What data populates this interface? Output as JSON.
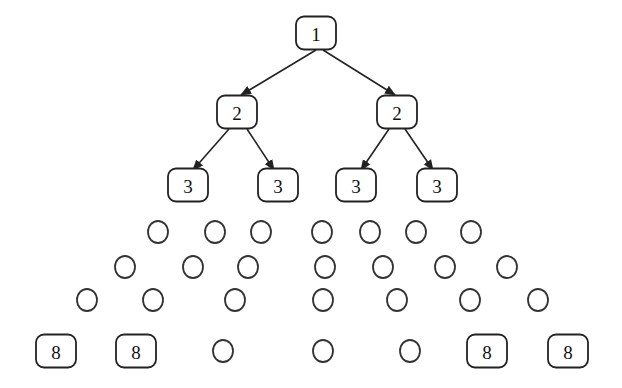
{
  "diagram": {
    "type": "tree",
    "levels": [
      {
        "level": 1,
        "y": 33,
        "nodes": [
          {
            "kind": "box",
            "label": "1",
            "x": 316
          }
        ]
      },
      {
        "level": 2,
        "y": 112,
        "nodes": [
          {
            "kind": "box",
            "label": "2",
            "x": 237
          },
          {
            "kind": "box",
            "label": "2",
            "x": 397
          }
        ]
      },
      {
        "level": 3,
        "y": 185,
        "nodes": [
          {
            "kind": "box",
            "label": "3",
            "x": 188
          },
          {
            "kind": "box",
            "label": "3",
            "x": 278
          },
          {
            "kind": "box",
            "label": "3",
            "x": 356
          },
          {
            "kind": "box",
            "label": "3",
            "x": 437
          }
        ]
      },
      {
        "level": 4,
        "y": 232,
        "nodes": [
          {
            "kind": "circle",
            "x": 158
          },
          {
            "kind": "circle",
            "x": 215
          },
          {
            "kind": "circle",
            "x": 261
          },
          {
            "kind": "circle",
            "x": 322
          },
          {
            "kind": "circle",
            "x": 370
          },
          {
            "kind": "circle",
            "x": 416
          },
          {
            "kind": "circle",
            "x": 471
          }
        ]
      },
      {
        "level": 5,
        "y": 267,
        "nodes": [
          {
            "kind": "circle",
            "x": 125
          },
          {
            "kind": "circle",
            "x": 193
          },
          {
            "kind": "circle",
            "x": 248
          },
          {
            "kind": "circle",
            "x": 325
          },
          {
            "kind": "circle",
            "x": 383
          },
          {
            "kind": "circle",
            "x": 445
          },
          {
            "kind": "circle",
            "x": 507
          }
        ]
      },
      {
        "level": 6,
        "y": 300,
        "nodes": [
          {
            "kind": "circle",
            "x": 87
          },
          {
            "kind": "circle",
            "x": 153
          },
          {
            "kind": "circle",
            "x": 235
          },
          {
            "kind": "circle",
            "x": 323
          },
          {
            "kind": "circle",
            "x": 397
          },
          {
            "kind": "circle",
            "x": 470
          },
          {
            "kind": "circle",
            "x": 538
          }
        ]
      },
      {
        "level": 7,
        "y": 351,
        "nodes": [
          {
            "kind": "box",
            "label": "8",
            "x": 56
          },
          {
            "kind": "box",
            "label": "8",
            "x": 136
          },
          {
            "kind": "circle",
            "x": 223
          },
          {
            "kind": "circle",
            "x": 323
          },
          {
            "kind": "circle",
            "x": 410
          },
          {
            "kind": "box",
            "label": "8",
            "x": 487
          },
          {
            "kind": "box",
            "label": "8",
            "x": 568
          }
        ]
      }
    ],
    "edges": [
      {
        "from": [
          316,
          50
        ],
        "to": [
          241,
          95
        ]
      },
      {
        "from": [
          323,
          50
        ],
        "to": [
          395,
          95
        ]
      },
      {
        "from": [
          229,
          129
        ],
        "to": [
          193,
          170
        ]
      },
      {
        "from": [
          247,
          129
        ],
        "to": [
          274,
          170
        ]
      },
      {
        "from": [
          389,
          129
        ],
        "to": [
          361,
          170
        ]
      },
      {
        "from": [
          405,
          129
        ],
        "to": [
          433,
          170
        ]
      }
    ]
  }
}
